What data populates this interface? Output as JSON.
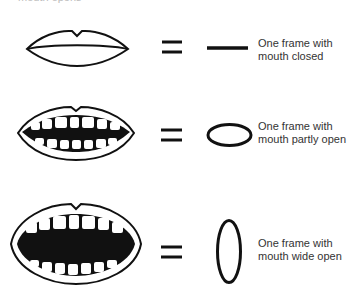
{
  "header": {
    "clipped_text": "mouth opens"
  },
  "rows": [
    {
      "state": "closed",
      "symbol": "horizontal-line",
      "caption_line1": "One frame with",
      "caption_line2": "mouth closed"
    },
    {
      "state": "partly-open",
      "symbol": "horizontal-oval",
      "caption_line1": "One frame with",
      "caption_line2": "mouth partly open"
    },
    {
      "state": "wide-open",
      "symbol": "vertical-oval",
      "caption_line1": "One frame with",
      "caption_line2": "mouth wide open"
    }
  ],
  "colors": {
    "ink": "#111111",
    "background": "#ffffff",
    "text": "#333333"
  }
}
